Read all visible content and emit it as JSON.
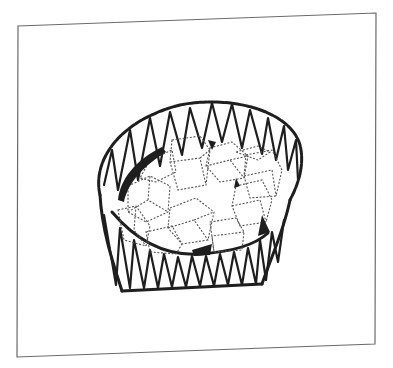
{
  "figure": {
    "frame_color": "#6a6a6a",
    "ink_color": "#1e1e1e",
    "cube_line_color": "#555555",
    "background": "#ffffff"
  }
}
